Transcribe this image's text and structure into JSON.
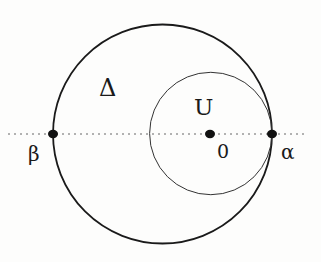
{
  "diagram": {
    "labels": {
      "big_region": "Δ",
      "small_region": "U",
      "center": "0",
      "right_point": "α",
      "left_point": "β"
    },
    "colors": {
      "stroke": "#1a1a1a",
      "thin_stroke": "#333333",
      "axis": "#666666",
      "background": "#fdfdfc"
    },
    "geometry": {
      "big_circle": {
        "cx": 162.5,
        "cy": 134,
        "r": 109.5
      },
      "small_circle": {
        "cx": 210.5,
        "cy": 134,
        "r": 61.5
      },
      "axis_line": {
        "x1": 8,
        "x2": 306,
        "y": 134
      },
      "points": [
        {
          "name": "β",
          "x": 53,
          "y": 134
        },
        {
          "name": "0",
          "x": 210,
          "y": 134
        },
        {
          "name": "α",
          "x": 272,
          "y": 134
        }
      ]
    }
  }
}
